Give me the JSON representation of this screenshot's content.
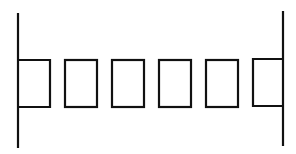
{
  "diagram": {
    "canvas": {
      "width": 296,
      "height": 154,
      "background": "#ffffff",
      "stroke_color": "#111111"
    },
    "vertical_lines": [
      {
        "id": "left-wall",
        "x": 18,
        "y1": 13,
        "y2": 148
      },
      {
        "id": "right-wall",
        "x": 283,
        "y1": 11,
        "y2": 146
      }
    ],
    "rectangles": [
      {
        "id": "box-1",
        "x": 18,
        "y": 60,
        "w": 32,
        "h": 47,
        "attached_to": "left-wall",
        "open_side": "left"
      },
      {
        "id": "box-2",
        "x": 65,
        "y": 60,
        "w": 32,
        "h": 47
      },
      {
        "id": "box-3",
        "x": 112,
        "y": 60,
        "w": 32,
        "h": 47
      },
      {
        "id": "box-4",
        "x": 159,
        "y": 60,
        "w": 32,
        "h": 47
      },
      {
        "id": "box-5",
        "x": 206,
        "y": 60,
        "w": 32,
        "h": 47
      },
      {
        "id": "box-6",
        "x": 253,
        "y": 59,
        "w": 30,
        "h": 47,
        "attached_to": "right-wall",
        "open_side": "right"
      }
    ],
    "description": "Two vertical lines with a row of six rectangles between them; the end rectangles share their outer edge with the vertical lines"
  }
}
